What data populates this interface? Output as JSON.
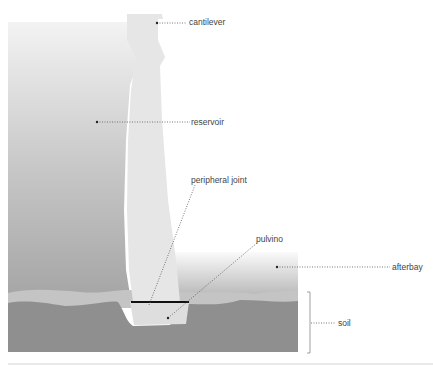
{
  "diagram": {
    "labels": {
      "cantilever": "cantilever",
      "reservoir": "reservoir",
      "peripheral_joint": "peripheral joint",
      "pulvino": "pulvino",
      "afterbay": "afterbay",
      "soil": "soil"
    },
    "colors": {
      "reservoir_top": "#f2f2f2",
      "reservoir_bottom": "#a9a9a9",
      "dam_body": "#e6e6e6",
      "afterbay_top": "#f4f4f4",
      "afterbay_bottom": "#b5b5b5",
      "sediment": "#c3c3c3",
      "soil": "#8f8f8f",
      "joint": "#111111",
      "leader": "#555555"
    }
  }
}
